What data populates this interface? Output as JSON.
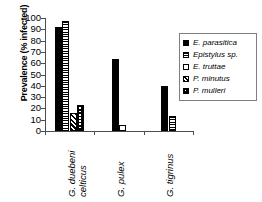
{
  "chart_data": {
    "type": "bar",
    "title": "",
    "xlabel": "",
    "ylabel": "Prevalence (% infected)",
    "ylim": [
      0,
      100
    ],
    "ytick_labels": [
      "0",
      "10",
      "20",
      "30",
      "40",
      "50",
      "60",
      "70",
      "80",
      "90",
      "100"
    ],
    "yticks": [
      0,
      10,
      20,
      30,
      40,
      50,
      60,
      70,
      80,
      90,
      100
    ],
    "grid": false,
    "legend_position": "right",
    "categories": [
      "G. duebeni celticus",
      "G. pulex",
      "G. tigrinus"
    ],
    "category_lines": [
      [
        "G. duebeni",
        "celticus"
      ],
      [
        "G. pulex",
        ""
      ],
      [
        "G. tigrinus",
        ""
      ]
    ],
    "series": [
      {
        "name": "E. parasitica",
        "fill": "solid",
        "values": [
          92,
          64,
          40
        ]
      },
      {
        "name": "Epistylus sp.",
        "fill": "horizontal-band",
        "values": [
          97,
          0,
          13
        ]
      },
      {
        "name": "E. truttae",
        "fill": "open",
        "values": [
          0,
          5,
          0
        ]
      },
      {
        "name": "P. minutus",
        "fill": "diagonal-hatch",
        "values": [
          16,
          0,
          0
        ]
      },
      {
        "name": "P. mulleri",
        "fill": "checker",
        "values": [
          23,
          0,
          0
        ]
      }
    ]
  },
  "legend": {
    "items": [
      {
        "label": "E. parasitica",
        "fill": "solid"
      },
      {
        "label": "Epistylus sp.",
        "fill": "horizontal-band"
      },
      {
        "label": "E. truttae",
        "fill": "open"
      },
      {
        "label": "P. minutus",
        "fill": "diagonal-hatch"
      },
      {
        "label": "P. mulleri",
        "fill": "checker"
      }
    ]
  },
  "colors": {
    "axis": "#4d4d4d",
    "series_ink": "#000000",
    "background": "#ffffff",
    "legend_border": "#7f7f7f"
  }
}
